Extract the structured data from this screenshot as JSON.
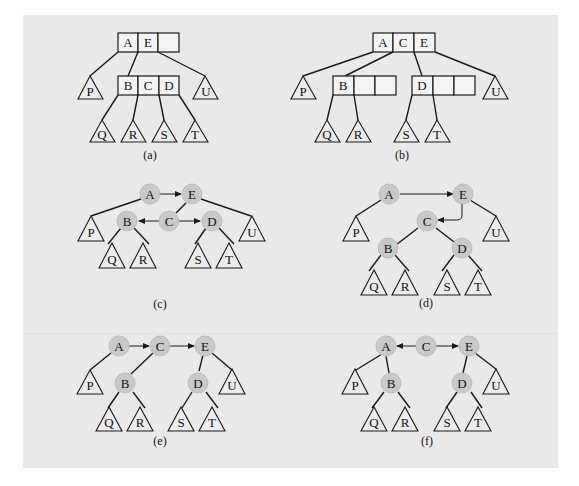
{
  "figure": {
    "background_color": "#e9e9e9",
    "node_fill_color": "#c9c9c9",
    "panels": [
      {
        "id": "a",
        "caption": "(a)",
        "type": "b-tree",
        "nodes": [
          {
            "id": "root",
            "keys": [
              "A",
              "E",
              ""
            ]
          },
          {
            "id": "child",
            "keys": [
              "B",
              "C",
              "D"
            ]
          }
        ],
        "subtrees": [
          "P",
          "Q",
          "R",
          "S",
          "T",
          "U"
        ]
      },
      {
        "id": "b",
        "caption": "(b)",
        "type": "b-tree",
        "nodes": [
          {
            "id": "root",
            "keys": [
              "A",
              "C",
              "E"
            ]
          },
          {
            "id": "left",
            "keys": [
              "B",
              "",
              ""
            ]
          },
          {
            "id": "right",
            "keys": [
              "D",
              "",
              ""
            ]
          }
        ],
        "subtrees": [
          "P",
          "Q",
          "R",
          "S",
          "T",
          "U"
        ]
      },
      {
        "id": "c",
        "caption": "(c)",
        "type": "vh-tree",
        "nodes": [
          "A",
          "E",
          "B",
          "C",
          "D"
        ],
        "subtrees": [
          "P",
          "Q",
          "R",
          "S",
          "T",
          "U"
        ]
      },
      {
        "id": "d",
        "caption": "(d)",
        "type": "vh-tree",
        "nodes": [
          "A",
          "E",
          "C",
          "B",
          "D"
        ],
        "subtrees": [
          "P",
          "Q",
          "R",
          "S",
          "T",
          "U"
        ]
      },
      {
        "id": "e",
        "caption": "(e)",
        "type": "vh-tree",
        "nodes": [
          "A",
          "C",
          "E",
          "B",
          "D"
        ],
        "subtrees": [
          "P",
          "Q",
          "R",
          "S",
          "T",
          "U"
        ]
      },
      {
        "id": "f",
        "caption": "(f)",
        "type": "vh-tree",
        "nodes": [
          "A",
          "C",
          "E",
          "B",
          "D"
        ],
        "subtrees": [
          "P",
          "Q",
          "R",
          "S",
          "T",
          "U"
        ]
      }
    ]
  }
}
